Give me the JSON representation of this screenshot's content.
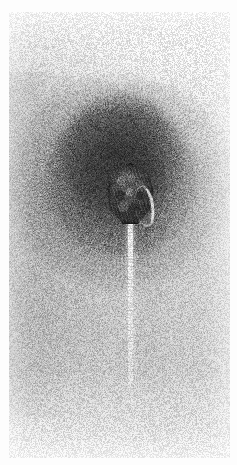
{
  "figure": {
    "kind": "transmission-electron-micrograph",
    "caption": "",
    "width_px": 237,
    "height_px": 465,
    "color_mode": "grayscale",
    "has_scale_bar": false,
    "has_labels": false,
    "has_text": false
  },
  "plate": {
    "margin_color": "#fdfdfd",
    "margin_left_px": 9,
    "margin_top_px": 12,
    "film_width_px": 221,
    "film_height_px": 446,
    "background_tone": "#cfcfcf",
    "highlight_tone": "#fbfbfb",
    "shadow_tone": "#c9c9c9",
    "grain": "fine photographic emulsion grain, diagonal carbon-film striations"
  },
  "specimen": {
    "head": {
      "name": "capsid-head",
      "shape": "icosahedral, hexagonal in outline",
      "center_x_px": 121,
      "center_y_px": 182,
      "width_px": 45,
      "height_px": 61,
      "fill_color": "#3a3a3a",
      "rim_color": "#141414",
      "texture": "mottled capsomere subunits, stain penetration",
      "highlight": {
        "name": "stain-exclusion-crescent",
        "position": "lower right flank",
        "color": "#f4f4f4"
      }
    },
    "tail": {
      "name": "contractile-tail",
      "orientation": "vertical, descending from head",
      "top_y_px": 209,
      "bottom_y_px": 391,
      "center_x_px": 121,
      "length_px": 182,
      "width_px": 5,
      "color": "#fafafa",
      "appearance": "bright stain-excluding filament with faint transverse striations, fading toward the distal tip"
    },
    "stain_halo": {
      "name": "negative-stain-halo",
      "center_x_px": 121,
      "center_y_px": 182,
      "radius_x_px": 115,
      "radius_y_px": 108,
      "color": "#282828",
      "appearance": "dark pooled uranyl stain radiating outward in fine striations"
    }
  }
}
